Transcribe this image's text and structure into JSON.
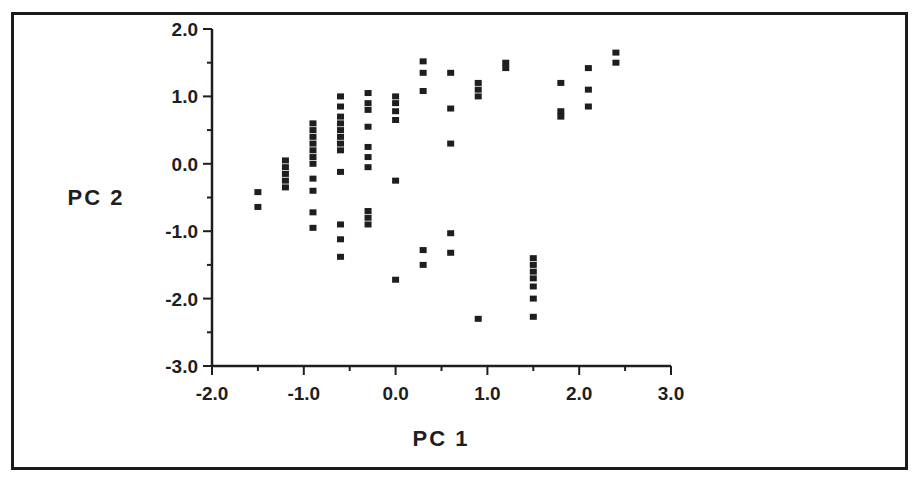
{
  "chart_data": {
    "type": "scatter",
    "title": "",
    "xlabel": "PC 1",
    "ylabel": "PC 2",
    "xlim": [
      -2.0,
      3.0
    ],
    "ylim": [
      -3.0,
      2.0
    ],
    "grid": false,
    "legend": null,
    "x_ticks": [
      "-2.0",
      "-1.0",
      "0.0",
      "1.0",
      "2.0",
      "3.0"
    ],
    "y_ticks": [
      "2.0",
      "1.0",
      "0.0",
      "-1.0",
      "-2.0",
      "-3.0"
    ],
    "marker": "square",
    "marker_color": "#1e1e1e",
    "points": [
      [
        -1.5,
        -0.42
      ],
      [
        -1.5,
        -0.64
      ],
      [
        -1.2,
        0.05
      ],
      [
        -1.2,
        -0.05
      ],
      [
        -1.2,
        -0.15
      ],
      [
        -1.2,
        -0.25
      ],
      [
        -1.2,
        -0.35
      ],
      [
        -0.9,
        0.6
      ],
      [
        -0.9,
        0.5
      ],
      [
        -0.9,
        0.4
      ],
      [
        -0.9,
        0.3
      ],
      [
        -0.9,
        0.2
      ],
      [
        -0.9,
        0.1
      ],
      [
        -0.9,
        0.0
      ],
      [
        -0.9,
        -0.22
      ],
      [
        -0.9,
        -0.4
      ],
      [
        -0.9,
        -0.72
      ],
      [
        -0.9,
        -0.95
      ],
      [
        -0.6,
        1.0
      ],
      [
        -0.6,
        0.85
      ],
      [
        -0.6,
        0.7
      ],
      [
        -0.6,
        0.6
      ],
      [
        -0.6,
        0.5
      ],
      [
        -0.6,
        0.4
      ],
      [
        -0.6,
        0.3
      ],
      [
        -0.6,
        0.2
      ],
      [
        -0.6,
        -0.12
      ],
      [
        -0.6,
        -0.9
      ],
      [
        -0.6,
        -1.12
      ],
      [
        -0.6,
        -1.38
      ],
      [
        -0.3,
        1.05
      ],
      [
        -0.3,
        0.9
      ],
      [
        -0.3,
        0.8
      ],
      [
        -0.3,
        0.55
      ],
      [
        -0.3,
        0.25
      ],
      [
        -0.3,
        0.1
      ],
      [
        -0.3,
        -0.05
      ],
      [
        -0.3,
        -0.7
      ],
      [
        -0.3,
        -0.8
      ],
      [
        -0.3,
        -0.9
      ],
      [
        0.0,
        1.0
      ],
      [
        0.0,
        0.9
      ],
      [
        0.0,
        0.78
      ],
      [
        0.0,
        0.65
      ],
      [
        0.0,
        -0.25
      ],
      [
        0.0,
        -1.72
      ],
      [
        0.3,
        1.52
      ],
      [
        0.3,
        1.35
      ],
      [
        0.3,
        1.08
      ],
      [
        0.3,
        -1.28
      ],
      [
        0.3,
        -1.5
      ],
      [
        0.6,
        1.35
      ],
      [
        0.6,
        0.82
      ],
      [
        0.6,
        0.3
      ],
      [
        0.6,
        -1.03
      ],
      [
        0.6,
        -1.32
      ],
      [
        0.9,
        1.2
      ],
      [
        0.9,
        1.1
      ],
      [
        0.9,
        1.0
      ],
      [
        0.9,
        -2.3
      ],
      [
        1.2,
        1.5
      ],
      [
        1.2,
        1.42
      ],
      [
        1.5,
        -1.4
      ],
      [
        1.5,
        -1.5
      ],
      [
        1.5,
        -1.6
      ],
      [
        1.5,
        -1.7
      ],
      [
        1.5,
        -1.82
      ],
      [
        1.5,
        -2.0
      ],
      [
        1.5,
        -2.27
      ],
      [
        1.8,
        1.2
      ],
      [
        1.8,
        0.78
      ],
      [
        1.8,
        0.7
      ],
      [
        2.1,
        1.42
      ],
      [
        2.1,
        1.1
      ],
      [
        2.1,
        0.85
      ],
      [
        2.4,
        1.65
      ],
      [
        2.4,
        1.5
      ]
    ]
  },
  "layout": {
    "x_axis_px": [
      212,
      671
    ],
    "y_axis_px": [
      29,
      366
    ],
    "axis_color": "#1e1e1e"
  }
}
